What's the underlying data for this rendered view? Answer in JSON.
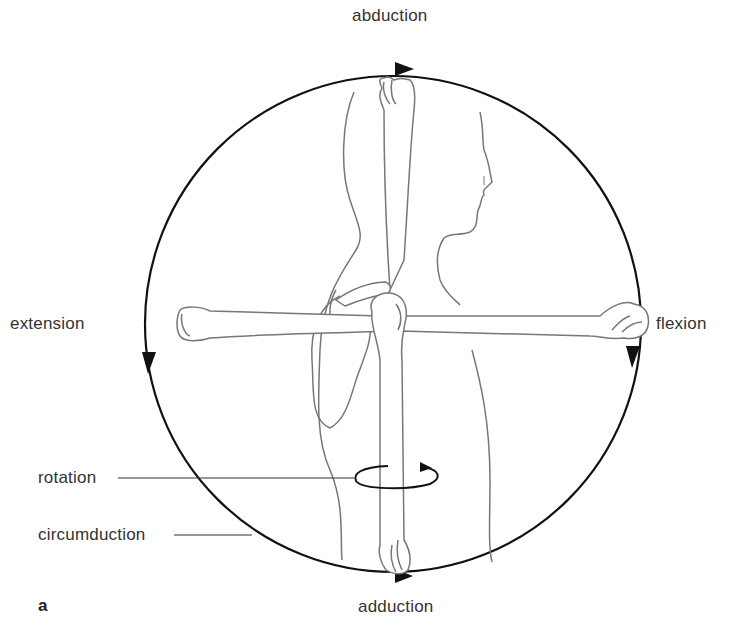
{
  "diagram": {
    "panel_letter": "a",
    "labels": {
      "top": "abduction",
      "bottom": "adduction",
      "left": "extension",
      "right": "flexion",
      "rotation": "rotation",
      "circumduction": "circumduction"
    },
    "colors": {
      "circle_stroke": "#111111",
      "drawing_stroke": "#777777",
      "text": "#333333",
      "background": "#ffffff"
    }
  }
}
